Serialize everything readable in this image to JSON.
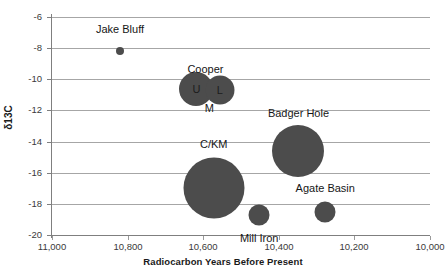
{
  "chart_data": {
    "type": "scatter",
    "title": "",
    "xlabel": "Radiocarbon Years Before Present",
    "ylabel": "δ13C",
    "xlim": [
      11000,
      10000
    ],
    "ylim": [
      -20,
      -6
    ],
    "x_reversed": true,
    "grid": true,
    "legend": "none",
    "xticks": [
      "11,000",
      "10,800",
      "10,600",
      "10,400",
      "10,200",
      "10,000"
    ],
    "xtick_values": [
      11000,
      10800,
      10600,
      10400,
      10200,
      10000
    ],
    "yticks": [
      "-6",
      "-8",
      "-10",
      "-12",
      "-14",
      "-16",
      "-18",
      "-20"
    ],
    "ytick_values": [
      -6,
      -8,
      -10,
      -12,
      -14,
      -16,
      -18,
      -20
    ],
    "marker_color": "#4c4c4c",
    "gridline_color": "#a6a6a6",
    "points": [
      {
        "name": "Jake Bluff",
        "label": "Jake Bluff",
        "x": 10820,
        "y": -8.2,
        "size": 8,
        "label_dx": 0,
        "label_dy": -22,
        "inner_letter": ""
      },
      {
        "name": "Cooper Upper",
        "label": "",
        "x": 10618,
        "y": -10.6,
        "size": 34,
        "label_dx": 0,
        "label_dy": 0,
        "inner_letter": "U"
      },
      {
        "name": "Cooper Lower",
        "label": "",
        "x": 10556,
        "y": -10.7,
        "size": 29,
        "label_dx": 0,
        "label_dy": 0,
        "inner_letter": "L"
      },
      {
        "name": "Badger Hole",
        "label": "Badger Hole",
        "x": 10348,
        "y": -14.6,
        "size": 52,
        "label_dx": 0,
        "label_dy": -38,
        "inner_letter": ""
      },
      {
        "name": "C/KM",
        "label": "C/KM",
        "x": 10572,
        "y": -17.0,
        "size": 61,
        "label_dx": 0,
        "label_dy": -44,
        "inner_letter": ""
      },
      {
        "name": "Mill Iron",
        "label": "Mill Iron",
        "x": 10452,
        "y": -18.7,
        "size": 21,
        "label_dx": 0,
        "label_dy": 23,
        "inner_letter": ""
      },
      {
        "name": "Agate Basin",
        "label": "Agate Basin",
        "x": 10277,
        "y": -18.5,
        "size": 21,
        "label_dx": 0,
        "label_dy": -24,
        "inner_letter": ""
      }
    ],
    "group_labels": [
      {
        "name": "Cooper",
        "text": "Cooper",
        "x": 10594,
        "y": -9.35
      },
      {
        "name": "Cooper Middle",
        "text": "M",
        "x": 10584,
        "y": -11.85
      }
    ]
  }
}
